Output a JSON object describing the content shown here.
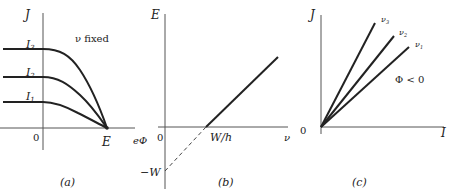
{
  "panels": {
    "a": {
      "caption": "(a)",
      "y_axis_label": "J",
      "x_axis_label": "eΦ",
      "origin_label": "0",
      "end_point_label": "E",
      "note": "ν fixed",
      "curves": [
        {
          "label": "I",
          "sub": "3"
        },
        {
          "label": "I",
          "sub": "2"
        },
        {
          "label": "I",
          "sub": "1"
        }
      ]
    },
    "b": {
      "caption": "(b)",
      "y_axis_label": "E",
      "x_axis_label": "ν",
      "origin_label": "0",
      "x_intercept_label": "W/h",
      "y_intercept_label": "−W"
    },
    "c": {
      "caption": "(c)",
      "y_axis_label": "J",
      "x_axis_label": "I",
      "origin_label": "0",
      "note": "Φ < 0",
      "lines": [
        {
          "label": "ν",
          "sub": "3"
        },
        {
          "label": "ν",
          "sub": "2"
        },
        {
          "label": "ν",
          "sub": "1"
        }
      ]
    }
  }
}
